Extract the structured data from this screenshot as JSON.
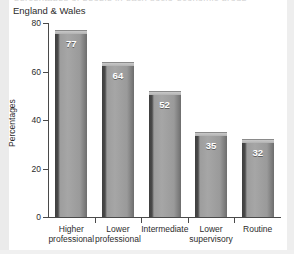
{
  "clipped_title_text": "percentages of people in each socio-economic group",
  "subtitle": "England & Wales",
  "chart_data": {
    "type": "bar",
    "title": "",
    "subtitle": "England & Wales",
    "xlabel": "",
    "ylabel": "Percentages",
    "categories": [
      "Higher professional",
      "Lower professional",
      "Intermediate",
      "Lower supervisory",
      "Routine"
    ],
    "category_lines": [
      [
        "Higher",
        "professional"
      ],
      [
        "Lower",
        "professional"
      ],
      [
        "Intermediate",
        ""
      ],
      [
        "Lower",
        "supervisory"
      ],
      [
        "Routine",
        ""
      ]
    ],
    "values": [
      77,
      64,
      52,
      35,
      32
    ],
    "value_labels": [
      "77",
      "64",
      "52",
      "35",
      "32"
    ],
    "ylim": [
      0,
      80
    ],
    "yticks": [
      0,
      20,
      40,
      60,
      80
    ],
    "ytick_labels": [
      "0",
      "20",
      "40",
      "60",
      "80"
    ],
    "grid": false,
    "legend": null,
    "bar_color": "#a2a2a2",
    "bar_shadow_color": "#3f3f3f",
    "axis_color": "#4a4a4a",
    "text_color": "#2c2c2c",
    "value_label_color": "#ffffff",
    "background": "#ffffff"
  }
}
